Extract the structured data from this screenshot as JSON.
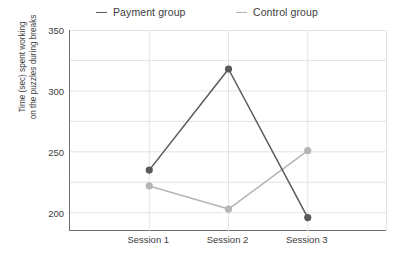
{
  "chart_data": {
    "type": "line",
    "title": "",
    "xlabel": "",
    "ylabel": "Time (sec) spent working on the puzzles during breaks",
    "ylabel_line1": "Time (sec) spent working",
    "ylabel_line2": "on the puzzles during breaks",
    "categories": [
      "Session 1",
      "Session 2",
      "Session 3"
    ],
    "ylim": [
      185,
      350
    ],
    "yticks": [
      200,
      250,
      300,
      350
    ],
    "ytick_labels": [
      "200",
      "250",
      "300",
      "350"
    ],
    "minor_gridlines": [
      200,
      225,
      250,
      275,
      300,
      325,
      350
    ],
    "grid": true,
    "legend_position": "top",
    "series": [
      {
        "name": "Payment group",
        "color": "#595959",
        "marker": "circle",
        "values": [
          235,
          318,
          196
        ]
      },
      {
        "name": "Control group",
        "color": "#b5b5b5",
        "marker": "circle",
        "values": [
          222,
          203,
          251
        ]
      }
    ]
  },
  "legend": {
    "entries": [
      {
        "label": "Payment group",
        "color": "#595959"
      },
      {
        "label": "Control group",
        "color": "#b5b5b5"
      }
    ]
  },
  "axes": {
    "y_title_line1": "Time (sec) spent working",
    "y_title_line2": "on the puzzles during breaks",
    "y_tick_labels": [
      "350",
      "300",
      "250",
      "200"
    ],
    "x_tick_labels": [
      "Session 1",
      "Session 2",
      "Session 3"
    ]
  },
  "colors": {
    "payment": "#595959",
    "control": "#b5b5b5",
    "axis": "#6d6d6d",
    "gridline": "#e3e3e3",
    "text": "#3d3d3d"
  }
}
